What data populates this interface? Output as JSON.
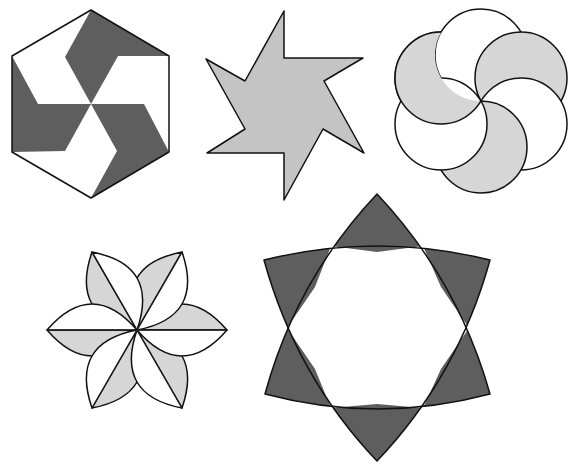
{
  "figure": {
    "title": "Rotational symmetry figures",
    "colors": {
      "background": "#ffffff",
      "outline": "#111111",
      "dark_gray": "#5e5e5e",
      "medium_gray": "#c4c4c4",
      "light_gray": "#d6d6d6",
      "white": "#ffffff"
    },
    "shapes": [
      {
        "id": "hexagon-pinwheel",
        "description": "Regular hexagon divided into a 3-fold pinwheel of dark gray and white pieces",
        "position": "top-left"
      },
      {
        "id": "six-point-pinwheel-star",
        "description": "Six-pointed pinwheel star filled light gray",
        "position": "top-center"
      },
      {
        "id": "six-circle-rosette",
        "description": "Six overlapping circles through a common center, alternating white and light gray",
        "position": "top-right"
      },
      {
        "id": "six-petal-flower",
        "description": "Six lens petals each split along its axis into a light gray and a white half",
        "position": "bottom-left"
      },
      {
        "id": "curved-hexagram",
        "description": "Curved six-pointed star with dark gray points around a white center",
        "position": "bottom-center"
      }
    ]
  }
}
